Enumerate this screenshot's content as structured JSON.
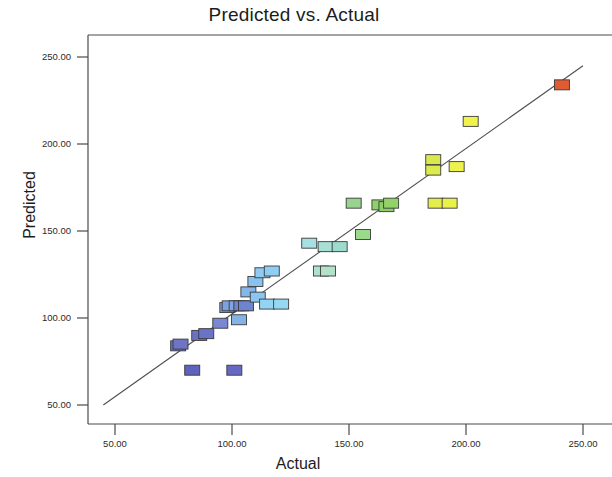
{
  "chart_data": {
    "type": "scatter",
    "title": "Predicted vs. Actual",
    "xlabel": "Actual",
    "ylabel": "Predicted",
    "xlim": [
      22,
      272
    ],
    "ylim": [
      39,
      262
    ],
    "grid": false,
    "legend": null,
    "x_ticks": [
      "50.00",
      "100.00",
      "150.00",
      "200.00",
      "250.00"
    ],
    "x_tick_values": [
      50,
      100,
      150,
      200,
      250
    ],
    "y_ticks": [
      "250.00",
      "200.00",
      "150.00",
      "100.00",
      "50.00"
    ],
    "y_tick_values": [
      250,
      200,
      150,
      100,
      50
    ],
    "reference_line": {
      "name": "identity-fit-line",
      "x_start": 45,
      "y_start": 50,
      "x_end": 250,
      "y_end": 245
    },
    "series": [
      {
        "name": "Predicted vs Actual points",
        "marker": "square",
        "color_scale": "blue-green-yellow-red by value",
        "points": [
          {
            "x": 77,
            "y": 84,
            "color": "#6b6fc0"
          },
          {
            "x": 78,
            "y": 85,
            "color": "#6f74c6"
          },
          {
            "x": 86,
            "y": 90,
            "color": "#6c71c4"
          },
          {
            "x": 89,
            "y": 91,
            "color": "#6a73c8"
          },
          {
            "x": 83,
            "y": 70,
            "color": "#5f63bd"
          },
          {
            "x": 101,
            "y": 70,
            "color": "#6569c4"
          },
          {
            "x": 95,
            "y": 97,
            "color": "#7a87d2"
          },
          {
            "x": 98,
            "y": 106,
            "color": "#7e9ddc"
          },
          {
            "x": 99,
            "y": 107,
            "color": "#7ea2de"
          },
          {
            "x": 102,
            "y": 107,
            "color": "#7fa6e0"
          },
          {
            "x": 104,
            "y": 107,
            "color": "#6e86d0"
          },
          {
            "x": 106,
            "y": 107,
            "color": "#6d84cf"
          },
          {
            "x": 103,
            "y": 99,
            "color": "#84b4e6"
          },
          {
            "x": 107,
            "y": 115,
            "color": "#84b6e8"
          },
          {
            "x": 110,
            "y": 121,
            "color": "#89c2ee"
          },
          {
            "x": 111,
            "y": 112,
            "color": "#8ac6f0"
          },
          {
            "x": 113,
            "y": 126,
            "color": "#8ecaf2"
          },
          {
            "x": 117,
            "y": 127,
            "color": "#8fcdf3"
          },
          {
            "x": 115,
            "y": 108,
            "color": "#93d4f4"
          },
          {
            "x": 121,
            "y": 108,
            "color": "#96d8f2"
          },
          {
            "x": 133,
            "y": 143,
            "color": "#a6e0e2"
          },
          {
            "x": 138,
            "y": 127,
            "color": "#aee2cf"
          },
          {
            "x": 141,
            "y": 127,
            "color": "#b2e3c8"
          },
          {
            "x": 140,
            "y": 141,
            "color": "#a8e0d6"
          },
          {
            "x": 146,
            "y": 141,
            "color": "#9ddccd"
          },
          {
            "x": 152,
            "y": 166,
            "color": "#98d48f"
          },
          {
            "x": 156,
            "y": 148,
            "color": "#9ada8a"
          },
          {
            "x": 163,
            "y": 165,
            "color": "#8fd06a"
          },
          {
            "x": 166,
            "y": 164,
            "color": "#8ccf68"
          },
          {
            "x": 168,
            "y": 166,
            "color": "#93d268"
          },
          {
            "x": 186,
            "y": 191,
            "color": "#d8e84e"
          },
          {
            "x": 186,
            "y": 185,
            "color": "#dbea4c"
          },
          {
            "x": 187,
            "y": 166,
            "color": "#e4ee4a"
          },
          {
            "x": 193,
            "y": 166,
            "color": "#eaf24a"
          },
          {
            "x": 196,
            "y": 187,
            "color": "#eef24c"
          },
          {
            "x": 202,
            "y": 213,
            "color": "#f2f24e"
          },
          {
            "x": 241,
            "y": 234,
            "color": "#e05a33"
          }
        ]
      }
    ]
  },
  "axis": {
    "y_title": "Predicted",
    "x_title": "Actual"
  }
}
